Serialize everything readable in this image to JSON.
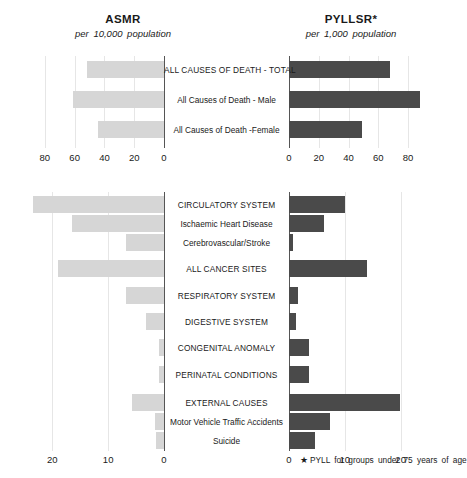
{
  "header": {
    "left": {
      "title": "ASMR",
      "subtitle": "per 10,000 population"
    },
    "right": {
      "title": "PYLLSR*",
      "subtitle": "per 1,000 population"
    }
  },
  "footnote": {
    "marker": "★",
    "text": "PYLL for groups under 75 years of age"
  },
  "colors": {
    "light_bar": "#d6d6d6",
    "dark_bar": "#4a4a4a",
    "axis": "#555555",
    "grid": "#e6e6e6",
    "text": "#1a1a1a",
    "background": "#ffffff"
  },
  "chart_data": [
    {
      "type": "bar",
      "id": "top-panel",
      "orientation": "horizontal",
      "title": "All Causes of Death",
      "categories": [
        "ALL CAUSES OF DEATH - TOTAL",
        "All Causes of Death - Male",
        "All Causes of Death -Female"
      ],
      "series": [
        {
          "name": "ASMR",
          "side": "left",
          "units": "per 10,000 population",
          "color": "#d6d6d6",
          "values": [
            52,
            61,
            44
          ],
          "xlim": [
            0,
            90
          ],
          "ticks": [
            80,
            60,
            40,
            20,
            0
          ],
          "direction": "right-to-left"
        },
        {
          "name": "PYLLSR",
          "side": "right",
          "units": "per 1,000 population",
          "color": "#4a4a4a",
          "values": [
            68,
            88,
            49
          ],
          "xlim": [
            0,
            90
          ],
          "ticks": [
            0,
            20,
            40,
            60,
            80
          ],
          "direction": "left-to-right"
        }
      ],
      "grid": true,
      "legend": "none"
    },
    {
      "type": "bar",
      "id": "bottom-panel",
      "orientation": "horizontal",
      "title": "Causes of Death by Category",
      "categories": [
        "CIRCULATORY SYSTEM",
        "Ischaemic Heart Disease",
        "Cerebrovascular/Stroke",
        "ALL CANCER SITES",
        "RESPIRATORY SYSTEM",
        "DIGESTIVE SYSTEM",
        "CONGENITAL ANOMALY",
        "PERINATAL CONDITIONS",
        "EXTERNAL CAUSES",
        "Motor Vehicle Traffic Accidents",
        "Suicide"
      ],
      "series": [
        {
          "name": "ASMR",
          "side": "left",
          "units": "per 10,000 population",
          "color": "#d6d6d6",
          "values": [
            23.5,
            16.5,
            6.8,
            19.0,
            6.8,
            3.2,
            0.9,
            0.9,
            5.8,
            1.7,
            1.4
          ],
          "xlim": [
            0,
            24
          ],
          "ticks": [
            20,
            10,
            0
          ],
          "direction": "right-to-left"
        },
        {
          "name": "PYLLSR",
          "side": "right",
          "units": "per 1,000 population",
          "color": "#4a4a4a",
          "values": [
            10.0,
            6.3,
            0.8,
            14.0,
            1.6,
            1.3,
            3.6,
            3.6,
            19.8,
            7.3,
            4.6
          ],
          "xlim": [
            0,
            24
          ],
          "ticks": [
            0,
            10,
            20
          ],
          "direction": "left-to-right"
        }
      ],
      "grid": true,
      "legend": "none"
    }
  ],
  "axes": {
    "top_left_ticks": [
      "80",
      "60",
      "40",
      "20",
      "0"
    ],
    "top_right_ticks": [
      "0",
      "20",
      "40",
      "60",
      "80"
    ],
    "bottom_left_ticks": [
      "20",
      "10",
      "0"
    ],
    "bottom_right_ticks": [
      "0",
      "10",
      "20"
    ]
  }
}
